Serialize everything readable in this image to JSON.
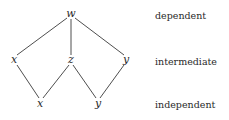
{
  "diagram": {
    "nodes": [
      {
        "id": "w",
        "label": "w",
        "level": "dependent"
      },
      {
        "id": "x_mid",
        "label": "x",
        "level": "intermediate"
      },
      {
        "id": "z",
        "label": "z",
        "level": "intermediate"
      },
      {
        "id": "y_mid",
        "label": "y",
        "level": "intermediate"
      },
      {
        "id": "x_bot",
        "label": "x",
        "level": "independent"
      },
      {
        "id": "y_bot",
        "label": "y",
        "level": "independent"
      }
    ],
    "edges": [
      {
        "from": "w",
        "to": "x_mid"
      },
      {
        "from": "w",
        "to": "z"
      },
      {
        "from": "w",
        "to": "y_mid"
      },
      {
        "from": "x_mid",
        "to": "x_bot"
      },
      {
        "from": "z",
        "to": "x_bot"
      },
      {
        "from": "z",
        "to": "y_bot"
      },
      {
        "from": "y_mid",
        "to": "y_bot"
      }
    ],
    "levels": {
      "top": "dependent",
      "middle": "intermediate",
      "bottom": "independent"
    }
  }
}
